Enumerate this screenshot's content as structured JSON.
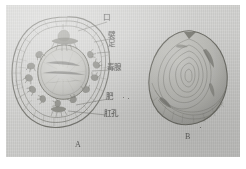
{
  "plate": {
    "caption_absent": true,
    "background_color": "#d6d6d4",
    "ink_color": "#4a4a46",
    "page_margin_color": "#ffffff"
  },
  "figures": [
    {
      "id": "A",
      "label": "A",
      "view": "oral-ventral-view",
      "description": "circular organism seen from the oral (ventral) side, showing central mouth disc ringed by papillae"
    },
    {
      "id": "B",
      "label": "B",
      "view": "lateral-view",
      "description": "same organism seen laterally, body covered with concentric growth ridges"
    }
  ],
  "annotations": [
    {
      "id": "mouth",
      "text": "口",
      "lines": [
        "口"
      ],
      "target_figure": "A"
    },
    {
      "id": "papilla",
      "text": "襞足",
      "lines": [
        "襞",
        "足"
      ],
      "target_figure": "A"
    },
    {
      "id": "poison-gland",
      "text": "毒腺",
      "lines": [
        "毒腺"
      ],
      "target_figure": "A"
    },
    {
      "id": "foot",
      "text": "肥",
      "lines": [
        "肥"
      ],
      "target_figure": "A"
    },
    {
      "id": "anal-pore",
      "text": "肛孔",
      "lines": [
        "肛孔"
      ],
      "target_figure": "A"
    }
  ]
}
